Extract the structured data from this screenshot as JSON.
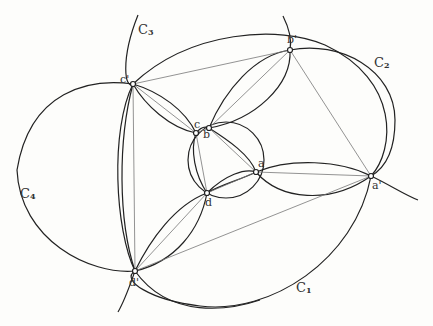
{
  "diagram": {
    "circle_labels": {
      "C1": {
        "letter": "C",
        "sub": "1"
      },
      "C2": {
        "letter": "C",
        "sub": "2"
      },
      "C3": {
        "letter": "C",
        "sub": "3"
      },
      "C4": {
        "letter": "C",
        "sub": "4"
      }
    },
    "points": {
      "a": "a",
      "b": "b",
      "c": "c",
      "d": "d",
      "a_prime": "a'",
      "b_prime": "b'",
      "c_prime": "c'",
      "d_prime": "d'"
    },
    "colors": {
      "stroke": "#222222",
      "thin": "#777777",
      "background": "#fdfdfb"
    }
  }
}
